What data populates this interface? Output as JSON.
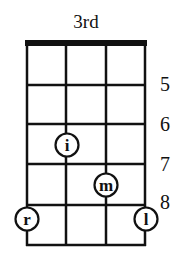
{
  "diagram": {
    "type": "chord-fingering",
    "position_label": "3rd",
    "strings": 4,
    "frets_shown": 5,
    "fret_numbers": [
      {
        "label": "5",
        "line_index": 1
      },
      {
        "label": "6",
        "line_index": 2
      },
      {
        "label": "7",
        "line_index": 3
      },
      {
        "label": "8",
        "line_index": 4
      }
    ],
    "fingers": [
      {
        "label": "i",
        "string": 1,
        "fret_row": 3,
        "name": "index"
      },
      {
        "label": "m",
        "string": 2,
        "fret_row": 4,
        "name": "middle"
      },
      {
        "label": "r",
        "string": 0,
        "fret_row": 5,
        "name": "ring"
      },
      {
        "label": "l",
        "string": 3,
        "fret_row": 5,
        "name": "little"
      }
    ],
    "colors": {
      "line": "#111111",
      "background": "#ffffff"
    }
  }
}
